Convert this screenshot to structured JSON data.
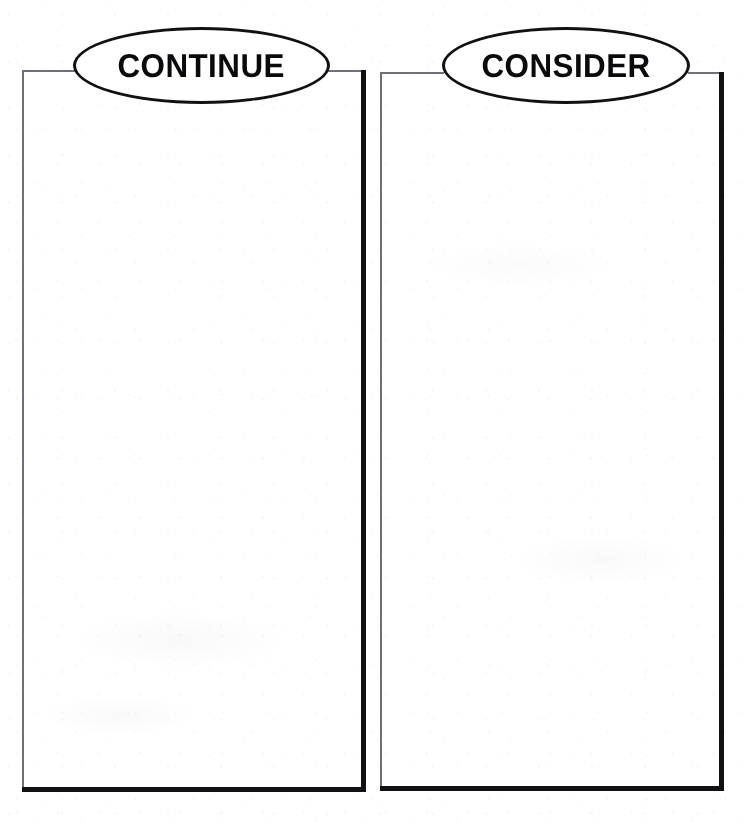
{
  "page": {
    "width": 749,
    "height": 823,
    "background_color": "#ffffff",
    "ink_color": "#111114",
    "light_rule_color": "#6f7176"
  },
  "panels": [
    {
      "id": "continue",
      "heading": "CONTINUE",
      "heading_shape": "ellipse",
      "body_text": "",
      "body_placeholder": "",
      "frame": {
        "x": 22,
        "y": 70,
        "width": 344,
        "height": 722
      },
      "bubble": {
        "x": 73,
        "y": 27,
        "width": 257,
        "height": 77
      }
    },
    {
      "id": "consider",
      "heading": "CONSIDER",
      "heading_shape": "ellipse",
      "body_text": "",
      "body_placeholder": "",
      "frame": {
        "x": 380,
        "y": 72,
        "width": 344,
        "height": 719
      },
      "bubble": {
        "x": 442,
        "y": 27,
        "width": 248,
        "height": 77
      }
    }
  ]
}
